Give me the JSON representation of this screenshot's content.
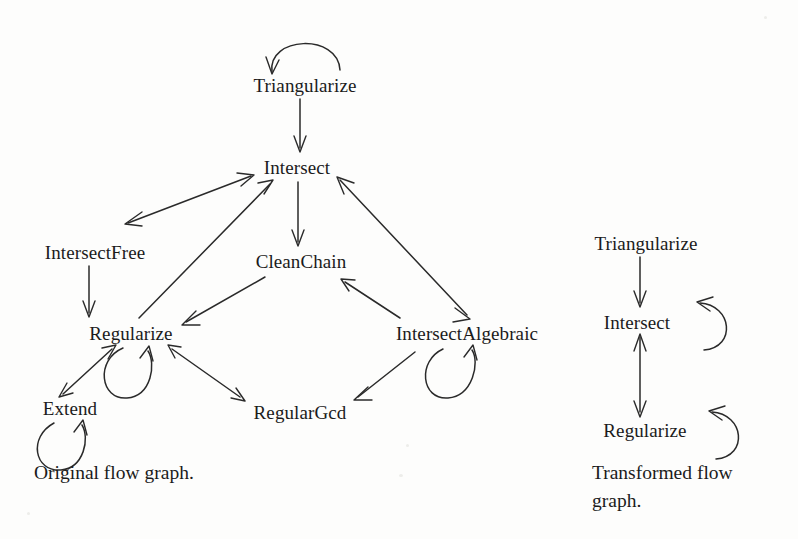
{
  "figure": {
    "background_color": "#fdfdfc",
    "ink_color": "#1b1b1b",
    "width": 798,
    "height": 539
  },
  "graphs": [
    {
      "id": "original",
      "caption": "Original flow graph.",
      "caption_x": 34,
      "caption_y": 459,
      "nodes": [
        {
          "id": "triangularize",
          "label": "Triangularize",
          "x": 305,
          "y": 85
        },
        {
          "id": "intersect",
          "label": "Intersect",
          "x": 297,
          "y": 167
        },
        {
          "id": "intersectfree",
          "label": "IntersectFree",
          "x": 95,
          "y": 252
        },
        {
          "id": "cleanchain",
          "label": "CleanChain",
          "x": 301,
          "y": 261
        },
        {
          "id": "regularize",
          "label": "Regularize",
          "x": 131,
          "y": 333
        },
        {
          "id": "intersectalgebraic",
          "label": "IntersectAlgebraic",
          "x": 467,
          "y": 333
        },
        {
          "id": "extend",
          "label": "Extend",
          "x": 70,
          "y": 408
        },
        {
          "id": "regulargcd",
          "label": "RegularGcd",
          "x": 300,
          "y": 412
        }
      ],
      "self_loops": [
        {
          "node": "triangularize",
          "placement": "above"
        },
        {
          "node": "regularize",
          "placement": "below"
        },
        {
          "node": "intersectalgebraic",
          "placement": "below"
        },
        {
          "node": "extend",
          "placement": "below"
        }
      ],
      "edges": [
        {
          "from": "triangularize",
          "to": "intersect",
          "direction": "one-way"
        },
        {
          "from": "intersect",
          "to": "intersectfree",
          "direction": "two-way"
        },
        {
          "from": "intersect",
          "to": "cleanchain",
          "direction": "one-way"
        },
        {
          "from": "intersectfree",
          "to": "regularize",
          "direction": "one-way"
        },
        {
          "from": "regularize",
          "to": "intersect",
          "direction": "one-way"
        },
        {
          "from": "cleanchain",
          "to": "regularize",
          "direction": "one-way"
        },
        {
          "from": "intersectalgebraic",
          "to": "intersect",
          "direction": "two-way"
        },
        {
          "from": "intersectalgebraic",
          "to": "cleanchain",
          "direction": "one-way"
        },
        {
          "from": "intersectalgebraic",
          "to": "regulargcd",
          "direction": "one-way"
        },
        {
          "from": "regulargcd",
          "to": "regularize",
          "direction": "two-way"
        },
        {
          "from": "regularize",
          "to": "extend",
          "direction": "two-way"
        }
      ]
    },
    {
      "id": "transformed",
      "caption": "Transformed flow\ngraph.",
      "caption_x": 592,
      "caption_y": 459,
      "nodes": [
        {
          "id": "t_triangularize",
          "label": "Triangularize",
          "x": 646,
          "y": 243
        },
        {
          "id": "t_intersect",
          "label": "Intersect",
          "x": 637,
          "y": 322
        },
        {
          "id": "t_regularize",
          "label": "Regularize",
          "x": 645,
          "y": 430
        }
      ],
      "self_loops": [
        {
          "node": "t_intersect",
          "placement": "right"
        },
        {
          "node": "t_regularize",
          "placement": "right"
        }
      ],
      "edges": [
        {
          "from": "t_triangularize",
          "to": "t_intersect",
          "direction": "one-way"
        },
        {
          "from": "t_intersect",
          "to": "t_regularize",
          "direction": "two-way"
        }
      ]
    }
  ]
}
